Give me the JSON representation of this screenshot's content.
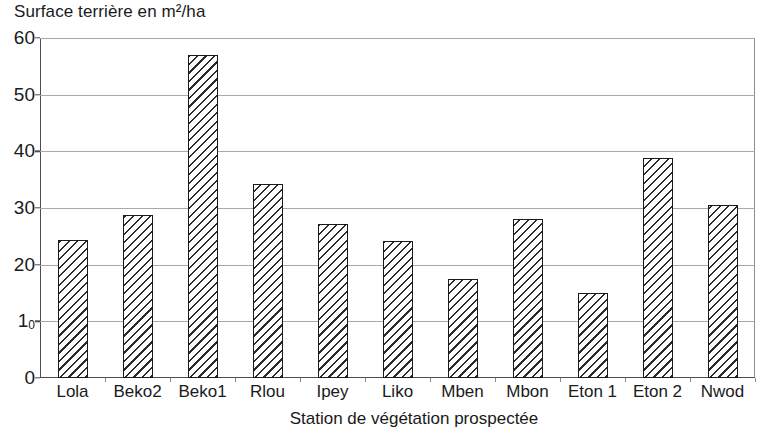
{
  "chart_data": {
    "type": "bar",
    "title": "Surface terrière en m²/ha",
    "xlabel": "Station de végétation prospectée",
    "ylabel": "",
    "categories": [
      "Lola",
      "Beko2",
      "Beko1",
      "Rlou",
      "Ipey",
      "Liko",
      "Mben",
      "Mbon",
      "Eton 1",
      "Eton 2",
      "Nwod"
    ],
    "values": [
      24.3,
      28.7,
      57.0,
      34.2,
      27.2,
      24.2,
      17.4,
      28.0,
      15.0,
      38.8,
      30.6
    ],
    "ylim": [
      0,
      60
    ],
    "yticks": [
      0,
      10,
      20,
      30,
      40,
      50,
      60
    ],
    "ytick_labels": [
      "0",
      "10",
      "20",
      "30",
      "40",
      "50",
      "60"
    ],
    "grid": true,
    "legend": false,
    "bar_fill": "diagonal-hatch",
    "bar_color": "#ffffff",
    "bar_edge_color": "#1a1a1a",
    "grid_color": "#a8a8a8",
    "axis_color": "#4d4d4d"
  }
}
